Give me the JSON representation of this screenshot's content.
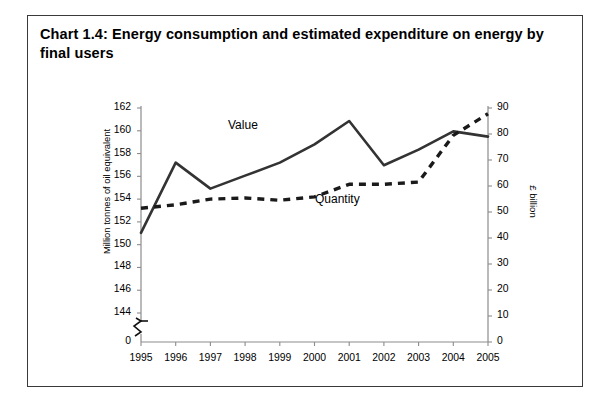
{
  "title": "Chart 1.4:  Energy consumption and estimated expenditure on energy by final users",
  "chart_data": {
    "type": "line",
    "title": "Chart 1.4:  Energy consumption and estimated expenditure on energy by final users",
    "xlabel": "",
    "ylabel": "Million tonnes of oil equivalent",
    "y2label": "£ billion",
    "x": [
      "1995",
      "1996",
      "1997",
      "1998",
      "1999",
      "2000",
      "2001",
      "2002",
      "2003",
      "2004",
      "2005"
    ],
    "categories": [
      "1995",
      "1996",
      "1997",
      "1998",
      "1999",
      "2000",
      "2001",
      "2002",
      "2003",
      "2004",
      "2005"
    ],
    "ylim": [
      144,
      162
    ],
    "y2lim": [
      0,
      90
    ],
    "yticks": [
      144,
      146,
      148,
      150,
      152,
      154,
      156,
      158,
      160,
      162
    ],
    "y2ticks": [
      0,
      10,
      20,
      30,
      40,
      50,
      60,
      70,
      80,
      90
    ],
    "y_axis_break": true,
    "y_axis_zero_label": "0",
    "y2_axis_zero_label": "0",
    "grid": false,
    "legend": "inline-annotation",
    "series": [
      {
        "name": "Value",
        "axis": "right",
        "units": "£ billion",
        "style": "solid",
        "color": "#333333",
        "values": [
          42,
          69,
          59,
          64,
          69,
          76,
          85,
          68,
          74,
          81,
          79
        ]
      },
      {
        "name": "Quantity",
        "axis": "left",
        "units": "Million tonnes of oil equivalent",
        "style": "dashed",
        "color": "#1a1a1a",
        "values": [
          153.2,
          153.5,
          154.0,
          154.1,
          153.9,
          154.2,
          155.3,
          155.3,
          155.5,
          159.6,
          161.5
        ]
      }
    ],
    "annotations": [
      {
        "text": "Value",
        "x": "1998",
        "y": 161.0
      },
      {
        "text": "Quantity",
        "x": "2001",
        "y": 152.6
      }
    ]
  },
  "ticks": {
    "left": [
      "162",
      "160",
      "158",
      "156",
      "154",
      "152",
      "150",
      "148",
      "146",
      "144",
      "0"
    ],
    "right": [
      "90",
      "80",
      "70",
      "60",
      "50",
      "40",
      "30",
      "20",
      "10",
      "0"
    ],
    "bottom": [
      "1995",
      "1996",
      "1997",
      "1998",
      "1999",
      "2000",
      "2001",
      "2002",
      "2003",
      "2004",
      "2005"
    ]
  },
  "labels": {
    "left_axis": "Million tonnes of oil equivalent",
    "right_axis": "£ billion",
    "value_series": "Value",
    "quantity_series": "Quantity"
  }
}
